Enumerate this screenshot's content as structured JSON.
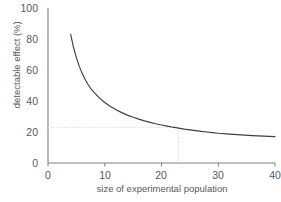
{
  "chart_data": {
    "type": "line",
    "title": "",
    "xlabel": "size of experimental population",
    "ylabel": "detectable effect (%)",
    "xlim": [
      0,
      40
    ],
    "ylim": [
      0,
      100
    ],
    "xticks": [
      "0",
      "10",
      "20",
      "30",
      "40"
    ],
    "yticks": [
      "0",
      "20",
      "40",
      "60",
      "80",
      "100"
    ],
    "xtick_values": [
      0,
      10,
      20,
      30,
      40
    ],
    "ytick_values": [
      0,
      20,
      40,
      60,
      80,
      100
    ],
    "grid": false,
    "legend": false,
    "series": [
      {
        "name": "minimum detectable effect",
        "color": "#3f3f3f",
        "x": [
          4,
          4.5,
          5,
          5.5,
          6,
          6.5,
          7,
          7.5,
          8,
          9,
          10,
          11,
          12,
          13,
          14,
          15,
          16,
          17,
          18,
          19,
          20,
          21,
          22,
          23,
          24,
          25,
          26,
          27,
          28,
          29,
          30,
          32,
          34,
          36,
          38,
          40
        ],
        "values": [
          83,
          74.5,
          68,
          62.5,
          58,
          54.2,
          51,
          48.2,
          46,
          42.2,
          39,
          36.5,
          34.3,
          32.5,
          30.9,
          29.5,
          28.3,
          27.2,
          26.2,
          25.3,
          24.5,
          23.8,
          23.1,
          22.5,
          21.9,
          21.4,
          20.9,
          20.4,
          20,
          19.6,
          19.2,
          18.6,
          18.1,
          17.7,
          17.3,
          17
        ]
      }
    ],
    "annotations": {
      "guide_x_value": 23,
      "guide_y_value": 23,
      "guide_color": "#d9d9d9",
      "guide_style": "dotted"
    },
    "axis_color": "#808080",
    "text_color": "#595959"
  }
}
